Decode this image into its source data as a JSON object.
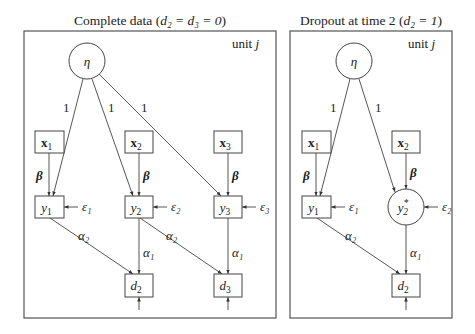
{
  "panels": [
    {
      "id": "complete",
      "title_prefix": "Complete data (",
      "title_math": "d₂ = d₃ = 0",
      "title_suffix": ")",
      "unit_label": "unit",
      "unit_var": "j",
      "frame": {
        "x": 24,
        "y": 31,
        "w": 252,
        "h": 287
      },
      "nodes": [
        {
          "id": "eta",
          "shape": "circle",
          "cx": 87,
          "cy": 61,
          "r": 18,
          "label": "η",
          "sub": ""
        },
        {
          "id": "x1",
          "shape": "rect",
          "x": 35,
          "y": 131,
          "w": 29,
          "h": 22,
          "label": "x",
          "sub": "1",
          "bold": true
        },
        {
          "id": "x2",
          "shape": "rect",
          "x": 125,
          "y": 131,
          "w": 28,
          "h": 22,
          "label": "x",
          "sub": "2",
          "bold": true
        },
        {
          "id": "x3",
          "shape": "rect",
          "x": 214,
          "y": 131,
          "w": 28,
          "h": 22,
          "label": "x",
          "sub": "3",
          "bold": true
        },
        {
          "id": "y1",
          "shape": "rect",
          "x": 35,
          "y": 196,
          "w": 29,
          "h": 22,
          "label": "y",
          "sub": "1"
        },
        {
          "id": "y2",
          "shape": "rect",
          "x": 125,
          "y": 196,
          "w": 28,
          "h": 22,
          "label": "y",
          "sub": "2"
        },
        {
          "id": "y3",
          "shape": "rect",
          "x": 214,
          "y": 196,
          "w": 28,
          "h": 22,
          "label": "y",
          "sub": "3"
        },
        {
          "id": "d2",
          "shape": "rect",
          "x": 125,
          "y": 274,
          "w": 28,
          "h": 23,
          "label": "d",
          "sub": "2"
        },
        {
          "id": "d3",
          "shape": "rect",
          "x": 214,
          "y": 274,
          "w": 28,
          "h": 23,
          "label": "d",
          "sub": "3"
        }
      ],
      "edges": [
        {
          "from": [
            83,
            79
          ],
          "to": [
            53,
            196
          ],
          "label": "1",
          "lx": 63,
          "ly": 112
        },
        {
          "from": [
            92,
            79
          ],
          "to": [
            133,
            196
          ],
          "label": "1",
          "lx": 108,
          "ly": 112
        },
        {
          "from": [
            99,
            74
          ],
          "to": [
            221,
            196
          ],
          "label": "1",
          "lx": 141,
          "ly": 112
        },
        {
          "from": [
            49,
            153
          ],
          "to": [
            49,
            196
          ],
          "label": "β",
          "lx": 36,
          "ly": 180,
          "bold": true
        },
        {
          "from": [
            139,
            153
          ],
          "to": [
            139,
            196
          ],
          "label": "β",
          "lx": 143,
          "ly": 180,
          "bold": true
        },
        {
          "from": [
            228,
            153
          ],
          "to": [
            228,
            196
          ],
          "label": "β",
          "lx": 232,
          "ly": 180,
          "bold": true
        },
        {
          "from": [
            50,
            218
          ],
          "to": [
            133,
            274
          ],
          "label": "α₂",
          "lx": 78,
          "ly": 240
        },
        {
          "from": [
            139,
            218
          ],
          "to": [
            139,
            274
          ],
          "label": "α₁",
          "lx": 143,
          "ly": 257
        },
        {
          "from": [
            140,
            218
          ],
          "to": [
            222,
            274
          ],
          "label": "α₂",
          "lx": 166,
          "ly": 240
        },
        {
          "from": [
            228,
            218
          ],
          "to": [
            228,
            274
          ],
          "label": "α₁",
          "lx": 232,
          "ly": 257
        },
        {
          "from": [
            139,
            310
          ],
          "to": [
            139,
            297
          ],
          "label": "",
          "lx": 0,
          "ly": 0
        },
        {
          "from": [
            228,
            310
          ],
          "to": [
            228,
            297
          ],
          "label": "",
          "lx": 0,
          "ly": 0
        },
        {
          "from": [
            78,
            207
          ],
          "to": [
            64,
            207
          ],
          "label": "ε₁",
          "lx": 82,
          "ly": 211
        },
        {
          "from": [
            167,
            207
          ],
          "to": [
            153,
            207
          ],
          "label": "ε₂",
          "lx": 171,
          "ly": 211
        },
        {
          "from": [
            256,
            207
          ],
          "to": [
            242,
            207
          ],
          "label": "ε₃",
          "lx": 260,
          "ly": 211
        }
      ]
    },
    {
      "id": "dropout",
      "title_prefix": "Dropout at time 2 (",
      "title_math": "d₂ = 1",
      "title_suffix": ")",
      "unit_label": "unit",
      "unit_var": "j",
      "frame": {
        "x": 290,
        "y": 31,
        "w": 162,
        "h": 287
      },
      "nodes": [
        {
          "id": "eta",
          "shape": "circle",
          "cx": 354,
          "cy": 61,
          "r": 18,
          "label": "η",
          "sub": ""
        },
        {
          "id": "x1",
          "shape": "rect",
          "x": 302,
          "y": 131,
          "w": 29,
          "h": 22,
          "label": "x",
          "sub": "1",
          "bold": true
        },
        {
          "id": "x2",
          "shape": "rect",
          "x": 392,
          "y": 131,
          "w": 28,
          "h": 22,
          "label": "x",
          "sub": "2",
          "bold": true
        },
        {
          "id": "y1",
          "shape": "rect",
          "x": 302,
          "y": 196,
          "w": 29,
          "h": 22,
          "label": "y",
          "sub": "1"
        },
        {
          "id": "y2star",
          "shape": "circle",
          "cx": 406,
          "cy": 207,
          "r": 18,
          "label": "y",
          "sub": "2",
          "sup": "*"
        },
        {
          "id": "d2",
          "shape": "rect",
          "x": 392,
          "y": 274,
          "w": 28,
          "h": 23,
          "label": "d",
          "sub": "2"
        }
      ],
      "edges": [
        {
          "from": [
            350,
            79
          ],
          "to": [
            320,
            196
          ],
          "label": "1",
          "lx": 330,
          "ly": 112
        },
        {
          "from": [
            359,
            79
          ],
          "to": [
            395,
            192
          ],
          "label": "1",
          "lx": 375,
          "ly": 112
        },
        {
          "from": [
            316,
            153
          ],
          "to": [
            316,
            196
          ],
          "label": "β",
          "lx": 303,
          "ly": 180,
          "bold": true
        },
        {
          "from": [
            406,
            153
          ],
          "to": [
            406,
            189
          ],
          "label": "β",
          "lx": 410,
          "ly": 177,
          "bold": true
        },
        {
          "from": [
            317,
            218
          ],
          "to": [
            400,
            274
          ],
          "label": "α₂",
          "lx": 345,
          "ly": 240
        },
        {
          "from": [
            406,
            225
          ],
          "to": [
            406,
            274
          ],
          "label": "α₁",
          "lx": 410,
          "ly": 257
        },
        {
          "from": [
            406,
            310
          ],
          "to": [
            406,
            297
          ],
          "label": "",
          "lx": 0,
          "ly": 0
        },
        {
          "from": [
            345,
            207
          ],
          "to": [
            331,
            207
          ],
          "label": "ε₁",
          "lx": 349,
          "ly": 211
        },
        {
          "from": [
            438,
            207
          ],
          "to": [
            424,
            207
          ],
          "label": "ε₂",
          "lx": 442,
          "ly": 211
        }
      ]
    }
  ]
}
